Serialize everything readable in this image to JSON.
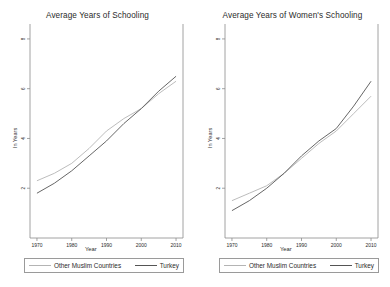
{
  "figure": {
    "background": "#ffffff",
    "panel_count": 2
  },
  "colors": {
    "turkey_line": "#555555",
    "other_muslim_line": "#b4b4b4",
    "axis": "#8c8c8c",
    "text": "#2b2b2b"
  },
  "legend": {
    "other_muslim_label": "Other Muslim Countries",
    "turkey_label": "Turkey"
  },
  "axes": {
    "ylabel": "In Years",
    "xlabel": "Year",
    "yticks": [
      "2",
      "4",
      "6",
      "8"
    ],
    "ytick_values": [
      2,
      4,
      6,
      8
    ],
    "xticks": [
      "1970",
      "1980",
      "1990",
      "2000",
      "2010"
    ],
    "xtick_values": [
      1970,
      1980,
      1990,
      2000,
      2010
    ]
  },
  "chart_data": [
    {
      "type": "line",
      "title": "Average Years of Schooling",
      "xlabel": "Year",
      "ylabel": "In Years",
      "xlim": [
        1968,
        2012
      ],
      "ylim": [
        0,
        8.6
      ],
      "xticks": [
        1970,
        1980,
        1990,
        2000,
        2010
      ],
      "yticks": [
        2,
        4,
        6,
        8
      ],
      "grid": false,
      "legend_position": "below",
      "x": [
        1970,
        1975,
        1980,
        1985,
        1990,
        1995,
        2000,
        2005,
        2010
      ],
      "series": [
        {
          "name": "Other Muslim Countries",
          "color": "#b4b4b4",
          "values": [
            2.3,
            2.6,
            3.0,
            3.6,
            4.3,
            4.8,
            5.2,
            5.8,
            6.3
          ]
        },
        {
          "name": "Turkey",
          "color": "#555555",
          "values": [
            1.8,
            2.2,
            2.7,
            3.3,
            3.9,
            4.6,
            5.2,
            5.9,
            6.5
          ]
        }
      ]
    },
    {
      "type": "line",
      "title": "Average Years of Women's Schooling",
      "xlabel": "Year",
      "ylabel": "In Years",
      "xlim": [
        1968,
        2012
      ],
      "ylim": [
        0,
        8.6
      ],
      "xticks": [
        1970,
        1980,
        1990,
        2000,
        2010
      ],
      "yticks": [
        2,
        4,
        6,
        8
      ],
      "grid": false,
      "legend_position": "below",
      "x": [
        1970,
        1975,
        1980,
        1985,
        1990,
        1995,
        2000,
        2005,
        2010
      ],
      "series": [
        {
          "name": "Other Muslim Countries",
          "color": "#b4b4b4",
          "values": [
            1.5,
            1.8,
            2.1,
            2.6,
            3.2,
            3.8,
            4.3,
            5.0,
            5.7
          ]
        },
        {
          "name": "Turkey",
          "color": "#555555",
          "values": [
            1.1,
            1.5,
            2.0,
            2.6,
            3.3,
            3.9,
            4.4,
            5.3,
            6.3
          ]
        }
      ]
    }
  ]
}
